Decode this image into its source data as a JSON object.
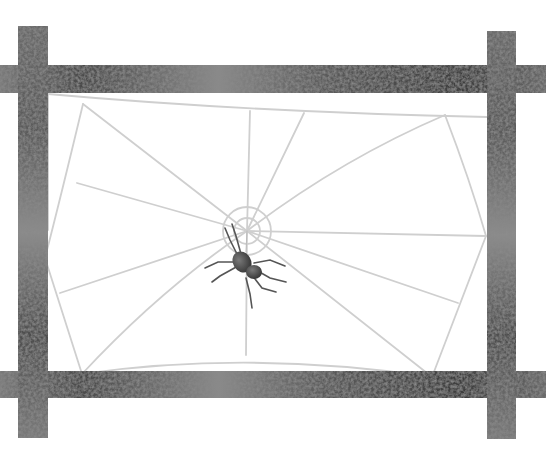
{
  "image": {
    "description": "Hand-drawn illustration of a spider sitting on a web strung inside a frame of four textured grey sticks",
    "alt": "Spider on a web within a stick frame"
  },
  "colors": {
    "background": "#ffffff",
    "stick_dark": "#3a3a3a",
    "stick_mid": "#6e6e6e",
    "stick_light": "#a8a8a8",
    "web": "#cfcfcf",
    "spider_body": "#4a4a4a",
    "spider_leg": "#555555"
  },
  "frame": {
    "left_post": {
      "x": 18,
      "y": 26,
      "w": 30,
      "h": 412
    },
    "right_post": {
      "x": 487,
      "y": 31,
      "w": 29,
      "h": 408
    },
    "top_bar": {
      "x": 0,
      "y": 65,
      "w": 546,
      "h": 28
    },
    "bottom_bar": {
      "x": 0,
      "y": 371,
      "w": 546,
      "h": 27
    }
  },
  "web": {
    "hub": {
      "x": 247,
      "y": 231
    },
    "hub_ring_radius": 24
  },
  "spider": {
    "x": 243,
    "y": 263
  }
}
